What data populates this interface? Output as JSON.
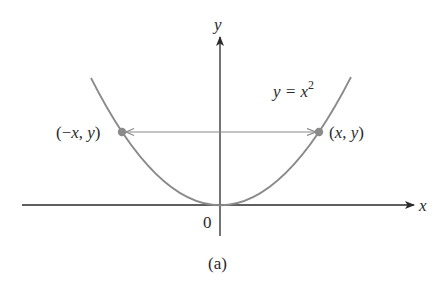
{
  "figure": {
    "caption": "(a)",
    "axes": {
      "x_label": "x",
      "y_label": "y",
      "origin_label": "0"
    },
    "curve": {
      "equation_lhs": "y = x",
      "equation_exp": "2",
      "color": "#8a8a8a"
    },
    "points": {
      "left": {
        "open": "(",
        "neg": "−",
        "x": "x",
        "comma": ", ",
        "y": "y",
        "close": ")"
      },
      "right": {
        "open": "(",
        "x": "x",
        "comma": ", ",
        "y": "y",
        "close": ")"
      },
      "color": "#8a8a8a"
    },
    "colors": {
      "axis": "#2a2a2a",
      "arrow": "#8a8a8a"
    }
  }
}
